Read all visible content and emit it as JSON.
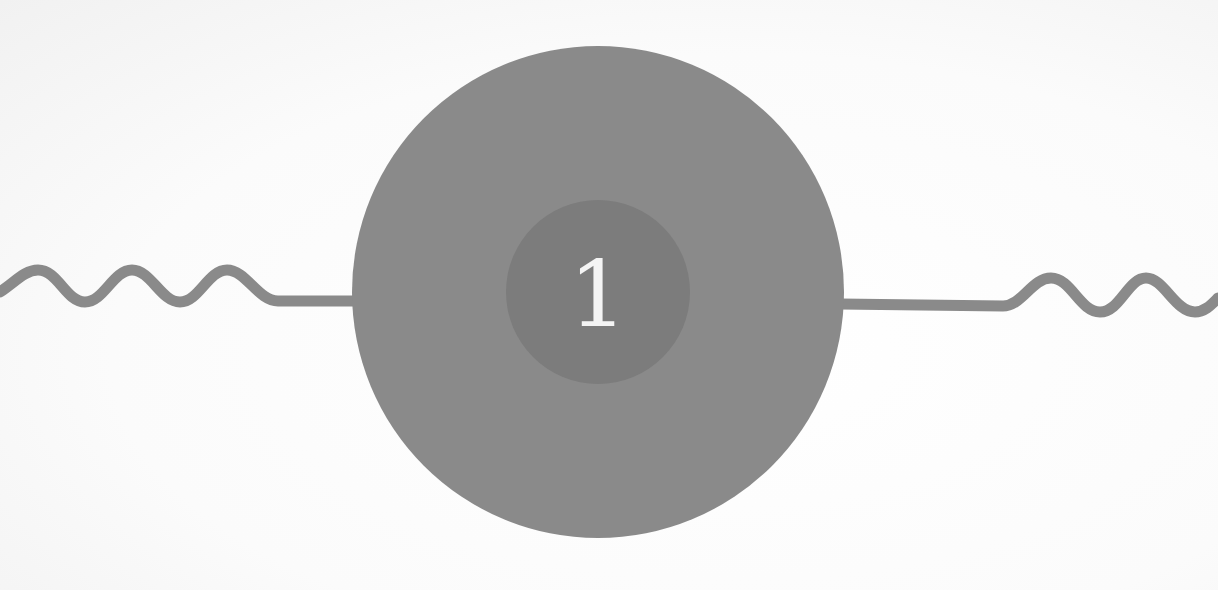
{
  "diagram": {
    "step_number": "1",
    "colors": {
      "background": "#fdfdfd",
      "outer_circle": "#8a8a8a",
      "inner_circle": "#7c7c7c",
      "number_text": "#f4f4f4",
      "connector_line": "#8a8a8a"
    },
    "elements": [
      "left-wavy-connector",
      "outer-circle",
      "inner-circle-with-number",
      "right-wavy-connector"
    ]
  }
}
